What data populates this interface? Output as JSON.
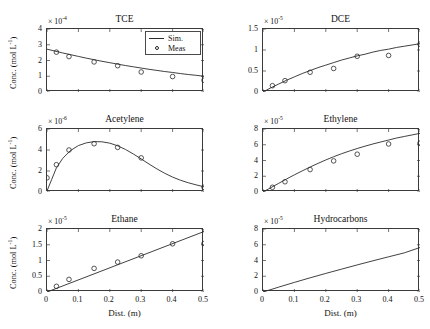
{
  "figure": {
    "background": "#ffffff",
    "axis_color": "#3a3a3a",
    "line_color": "#2b2b2b",
    "marker_color": "#2b2b2b",
    "xlabel": "Dist. (m)",
    "ylabel": "Conc. (mol L",
    "ylabel_exponent": "-1",
    "ylabel_close": ")",
    "legend": {
      "sim_label": "Sim.",
      "meas_label": "Meas"
    }
  },
  "chart_data": [
    {
      "type": "line",
      "title": "TCE",
      "xlabel": "Dist. (m)",
      "ylabel": "Conc. (mol L-1)",
      "exponent_text": "× 10",
      "exponent_power": "-4",
      "y_scale": 0.0001,
      "xlim": [
        0,
        0.5
      ],
      "ylim": [
        0,
        4
      ],
      "xticks": [
        0,
        0.1,
        0.2,
        0.3,
        0.4,
        0.5
      ],
      "xticklabels": [
        "0",
        "0.1",
        "0.2",
        "0.3",
        "0.4",
        "0.5"
      ],
      "yticks": [
        0,
        1,
        2,
        3,
        4
      ],
      "yticklabels": [
        "0",
        "1",
        "2",
        "3",
        "4"
      ],
      "grid": false,
      "legend_position": "upper-right",
      "series": [
        {
          "name": "Sim.",
          "style": "line",
          "x": [
            0,
            0.025,
            0.05,
            0.075,
            0.1,
            0.125,
            0.15,
            0.175,
            0.2,
            0.225,
            0.25,
            0.275,
            0.3,
            0.325,
            0.35,
            0.375,
            0.4,
            0.425,
            0.45,
            0.475,
            0.5
          ],
          "values": [
            2.72,
            2.6,
            2.48,
            2.37,
            2.26,
            2.15,
            2.05,
            1.95,
            1.86,
            1.77,
            1.68,
            1.6,
            1.52,
            1.44,
            1.37,
            1.3,
            1.24,
            1.17,
            1.11,
            1.06,
            1.0
          ]
        },
        {
          "name": "Meas",
          "style": "marker",
          "x": [
            0.03,
            0.07,
            0.15,
            0.225,
            0.3,
            0.4,
            0.5
          ],
          "values": [
            2.53,
            2.25,
            1.91,
            1.67,
            1.27,
            0.98,
            0.75
          ]
        }
      ]
    },
    {
      "type": "line",
      "title": "DCE",
      "xlabel": "Dist. (m)",
      "ylabel": "Conc. (mol L-1)",
      "exponent_text": "× 10",
      "exponent_power": "-5",
      "y_scale": 1e-05,
      "xlim": [
        0,
        0.5
      ],
      "ylim": [
        0,
        1.5
      ],
      "xticks": [
        0,
        0.1,
        0.2,
        0.3,
        0.4,
        0.5
      ],
      "xticklabels": [
        "0",
        "0.1",
        "0.2",
        "0.3",
        "0.4",
        "0.5"
      ],
      "yticks": [
        0,
        0.5,
        1,
        1.5
      ],
      "yticklabels": [
        "0",
        "0.5",
        "1",
        "1.5"
      ],
      "grid": false,
      "series": [
        {
          "name": "Sim.",
          "style": "line",
          "x": [
            0,
            0.025,
            0.05,
            0.075,
            0.1,
            0.125,
            0.15,
            0.175,
            0.2,
            0.225,
            0.25,
            0.275,
            0.3,
            0.325,
            0.35,
            0.375,
            0.4,
            0.425,
            0.45,
            0.475,
            0.5
          ],
          "values": [
            0.0,
            0.1,
            0.19,
            0.28,
            0.36,
            0.44,
            0.51,
            0.58,
            0.64,
            0.7,
            0.76,
            0.81,
            0.86,
            0.9,
            0.95,
            0.99,
            1.02,
            1.06,
            1.09,
            1.12,
            1.15
          ]
        },
        {
          "name": "Meas",
          "style": "marker",
          "x": [
            0.03,
            0.07,
            0.15,
            0.225,
            0.3,
            0.4,
            0.5
          ],
          "values": [
            0.15,
            0.27,
            0.47,
            0.56,
            0.85,
            0.87,
            1.14
          ]
        }
      ]
    },
    {
      "type": "line",
      "title": "Acetylene",
      "xlabel": "Dist. (m)",
      "ylabel": "Conc. (mol L-1)",
      "exponent_text": "× 10",
      "exponent_power": "-6",
      "y_scale": 1e-06,
      "xlim": [
        0,
        0.5
      ],
      "ylim": [
        0,
        6
      ],
      "xticks": [
        0,
        0.1,
        0.2,
        0.3,
        0.4,
        0.5
      ],
      "xticklabels": [
        "0",
        "0.1",
        "0.2",
        "0.3",
        "0.4",
        "0.5"
      ],
      "yticks": [
        0,
        2,
        4,
        6
      ],
      "yticklabels": [
        "0",
        "2",
        "4",
        "6"
      ],
      "grid": false,
      "series": [
        {
          "name": "Sim.",
          "style": "line",
          "x": [
            0,
            0.015,
            0.03,
            0.05,
            0.075,
            0.1,
            0.125,
            0.15,
            0.175,
            0.2,
            0.225,
            0.25,
            0.275,
            0.3,
            0.325,
            0.35,
            0.375,
            0.4,
            0.425,
            0.45,
            0.475,
            0.5
          ],
          "values": [
            0.1,
            1.2,
            2.3,
            3.2,
            3.95,
            4.42,
            4.68,
            4.8,
            4.78,
            4.65,
            4.4,
            4.05,
            3.62,
            3.15,
            2.66,
            2.2,
            1.78,
            1.42,
            1.12,
            0.88,
            0.68,
            0.5
          ]
        },
        {
          "name": "Meas",
          "style": "marker",
          "x": [
            0.0,
            0.03,
            0.07,
            0.15,
            0.225,
            0.3,
            0.5
          ],
          "values": [
            1.35,
            2.6,
            4.0,
            4.6,
            4.25,
            3.25,
            0.45
          ]
        }
      ]
    },
    {
      "type": "line",
      "title": "Ethylene",
      "xlabel": "Dist. (m)",
      "ylabel": "Conc. (mol L-1)",
      "exponent_text": "× 10",
      "exponent_power": "-5",
      "y_scale": 1e-05,
      "xlim": [
        0,
        0.5
      ],
      "ylim": [
        0,
        8
      ],
      "xticks": [
        0,
        0.1,
        0.2,
        0.3,
        0.4,
        0.5
      ],
      "xticklabels": [
        "0",
        "0.1",
        "0.2",
        "0.3",
        "0.4",
        "0.5"
      ],
      "yticks": [
        0,
        2,
        4,
        6,
        8
      ],
      "yticklabels": [
        "0",
        "2",
        "4",
        "6",
        "8"
      ],
      "grid": false,
      "series": [
        {
          "name": "Sim.",
          "style": "line",
          "x": [
            0,
            0.025,
            0.05,
            0.075,
            0.1,
            0.125,
            0.15,
            0.175,
            0.2,
            0.225,
            0.25,
            0.275,
            0.3,
            0.325,
            0.35,
            0.375,
            0.4,
            0.425,
            0.45,
            0.475,
            0.5
          ],
          "values": [
            0.0,
            0.55,
            1.1,
            1.65,
            2.18,
            2.68,
            3.17,
            3.63,
            4.07,
            4.48,
            4.86,
            5.2,
            5.52,
            5.82,
            6.1,
            6.35,
            6.6,
            6.85,
            7.05,
            7.25,
            7.45
          ]
        },
        {
          "name": "Meas",
          "style": "marker",
          "x": [
            0.03,
            0.07,
            0.15,
            0.225,
            0.3,
            0.4,
            0.5
          ],
          "values": [
            0.6,
            1.3,
            2.85,
            3.95,
            4.8,
            6.1,
            6.2
          ]
        }
      ]
    },
    {
      "type": "line",
      "title": "Ethane",
      "xlabel": "Dist. (m)",
      "ylabel": "Conc. (mol L-1)",
      "exponent_text": "× 10",
      "exponent_power": "-5",
      "y_scale": 1e-05,
      "xlim": [
        0,
        0.5
      ],
      "ylim": [
        0,
        2
      ],
      "xticks": [
        0,
        0.1,
        0.2,
        0.3,
        0.4,
        0.5
      ],
      "xticklabels": [
        "0",
        "0.1",
        "0.2",
        "0.3",
        "0.4",
        "0.5"
      ],
      "yticks": [
        0,
        0.5,
        1,
        1.5,
        2
      ],
      "yticklabels": [
        "0",
        "0.5",
        "1",
        "1.5",
        "2"
      ],
      "grid": false,
      "series": [
        {
          "name": "Sim.",
          "style": "line",
          "x": [
            0,
            0.5
          ],
          "values": [
            0.0,
            1.92
          ]
        },
        {
          "name": "Meas",
          "style": "marker",
          "x": [
            0.03,
            0.07,
            0.15,
            0.225,
            0.3,
            0.4,
            0.5
          ],
          "values": [
            0.18,
            0.4,
            0.75,
            0.95,
            1.15,
            1.53,
            1.54
          ]
        }
      ]
    },
    {
      "type": "line",
      "title": "Hydrocarbons",
      "xlabel": "Dist. (m)",
      "ylabel": "Conc. (mol L-1)",
      "exponent_text": "× 10",
      "exponent_power": "-5",
      "y_scale": 1e-05,
      "xlim": [
        0,
        0.5
      ],
      "ylim": [
        0,
        8
      ],
      "xticks": [
        0,
        0.1,
        0.2,
        0.3,
        0.4,
        0.5
      ],
      "xticklabels": [
        "0",
        "0.1",
        "0.2",
        "0.3",
        "0.4",
        "0.5"
      ],
      "yticks": [
        0,
        2,
        4,
        6,
        8
      ],
      "yticklabels": [
        "0",
        "2",
        "4",
        "6",
        "8"
      ],
      "grid": false,
      "series": [
        {
          "name": "Sim.",
          "style": "line",
          "x": [
            0,
            0.05,
            0.1,
            0.15,
            0.2,
            0.25,
            0.3,
            0.35,
            0.4,
            0.45,
            0.5
          ],
          "values": [
            0.0,
            0.62,
            1.22,
            1.8,
            2.36,
            2.9,
            3.44,
            3.96,
            4.47,
            4.97,
            5.65
          ]
        }
      ]
    }
  ]
}
